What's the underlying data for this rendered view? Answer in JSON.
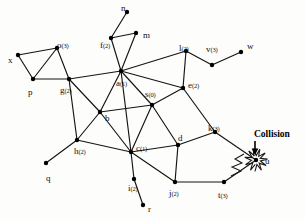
{
  "diagram": {
    "annotation": {
      "collision_label": "Collision",
      "arrow_glyph": "down-arrow"
    },
    "style": {
      "edge_color": "#141414",
      "node_color": "#000000",
      "background": "#fdfdfc",
      "burst_color": "#1a1a1a"
    },
    "nodes": [
      {
        "id": "x",
        "label": "x",
        "sub": "",
        "x": 18,
        "y": 55,
        "lx": 8,
        "ly": 56
      },
      {
        "id": "o",
        "label": "o",
        "sub": "(3)",
        "x": 57,
        "y": 48,
        "lx": 57,
        "ly": 41
      },
      {
        "id": "p",
        "label": "p",
        "sub": "",
        "x": 33,
        "y": 79,
        "lx": 28,
        "ly": 88
      },
      {
        "id": "g",
        "label": "g",
        "sub": "(2)",
        "x": 69,
        "y": 79,
        "lx": 60,
        "ly": 86
      },
      {
        "id": "n",
        "label": "n",
        "sub": "",
        "x": 127,
        "y": 12,
        "lx": 121,
        "ly": 4
      },
      {
        "id": "f",
        "label": "f",
        "sub": "(2)",
        "x": 111,
        "y": 38,
        "lx": 100,
        "ly": 41
      },
      {
        "id": "m",
        "label": "m",
        "sub": "",
        "x": 136,
        "y": 33,
        "lx": 143,
        "ly": 31
      },
      {
        "id": "a",
        "label": "a",
        "sub": "(1)",
        "x": 121,
        "y": 71,
        "lx": 116,
        "ly": 79
      },
      {
        "id": "l",
        "label": "l",
        "sub": "(2)",
        "x": 186,
        "y": 51,
        "lx": 179,
        "ly": 44
      },
      {
        "id": "v",
        "label": "v",
        "sub": "(3)",
        "x": 212,
        "y": 65,
        "lx": 206,
        "ly": 45
      },
      {
        "id": "w",
        "label": "w",
        "sub": "",
        "x": 241,
        "y": 52,
        "lx": 247,
        "ly": 42
      },
      {
        "id": "e",
        "label": "e",
        "sub": "(2)",
        "x": 183,
        "y": 88,
        "lx": 188,
        "ly": 81
      },
      {
        "id": "s",
        "label": "s",
        "sub": "(0)",
        "x": 152,
        "y": 105,
        "lx": 145,
        "ly": 90
      },
      {
        "id": "b",
        "label": "b",
        "sub": "",
        "x": 100,
        "y": 112,
        "lx": 105,
        "ly": 114
      },
      {
        "id": "h",
        "label": "h",
        "sub": "(2)",
        "x": 77,
        "y": 140,
        "lx": 74,
        "ly": 147
      },
      {
        "id": "q",
        "label": "q",
        "sub": "",
        "x": 46,
        "y": 163,
        "lx": 46,
        "ly": 174
      },
      {
        "id": "c",
        "label": "c",
        "sub": "(1)",
        "x": 131,
        "y": 152,
        "lx": 136,
        "ly": 144
      },
      {
        "id": "i",
        "label": "i",
        "sub": "(2)",
        "x": 134,
        "y": 179,
        "lx": 128,
        "ly": 184
      },
      {
        "id": "r",
        "label": "r",
        "sub": "",
        "x": 143,
        "y": 205,
        "lx": 148,
        "ly": 205
      },
      {
        "id": "d",
        "label": "d",
        "sub": "",
        "x": 178,
        "y": 145,
        "lx": 178,
        "ly": 134
      },
      {
        "id": "k",
        "label": "k",
        "sub": "(3)",
        "x": 215,
        "y": 132,
        "lx": 208,
        "ly": 124
      },
      {
        "id": "j",
        "label": "j",
        "sub": "(2)",
        "x": 175,
        "y": 182,
        "lx": 169,
        "ly": 189
      },
      {
        "id": "t",
        "label": "t",
        "sub": "(3)",
        "x": 224,
        "y": 182,
        "lx": 218,
        "ly": 191
      },
      {
        "id": "u",
        "label": "u",
        "sub": "",
        "x": 256,
        "y": 160,
        "lx": 265,
        "ly": 157
      }
    ],
    "edges": [
      [
        "x",
        "o"
      ],
      [
        "x",
        "p"
      ],
      [
        "o",
        "p"
      ],
      [
        "o",
        "g"
      ],
      [
        "p",
        "g"
      ],
      [
        "n",
        "f"
      ],
      [
        "f",
        "m"
      ],
      [
        "f",
        "a"
      ],
      [
        "m",
        "a"
      ],
      [
        "g",
        "a"
      ],
      [
        "g",
        "b"
      ],
      [
        "g",
        "h"
      ],
      [
        "a",
        "b"
      ],
      [
        "a",
        "s"
      ],
      [
        "a",
        "e"
      ],
      [
        "a",
        "l"
      ],
      [
        "a",
        "c"
      ],
      [
        "l",
        "v"
      ],
      [
        "v",
        "w"
      ],
      [
        "l",
        "e"
      ],
      [
        "e",
        "s"
      ],
      [
        "e",
        "k"
      ],
      [
        "s",
        "b"
      ],
      [
        "s",
        "c"
      ],
      [
        "s",
        "d"
      ],
      [
        "b",
        "h"
      ],
      [
        "b",
        "c"
      ],
      [
        "h",
        "q"
      ],
      [
        "h",
        "c"
      ],
      [
        "c",
        "i"
      ],
      [
        "i",
        "r"
      ],
      [
        "c",
        "d"
      ],
      [
        "c",
        "j"
      ],
      [
        "d",
        "k"
      ],
      [
        "d",
        "j"
      ],
      [
        "j",
        "t"
      ],
      [
        "k",
        "u"
      ],
      [
        "t",
        "u"
      ]
    ]
  }
}
